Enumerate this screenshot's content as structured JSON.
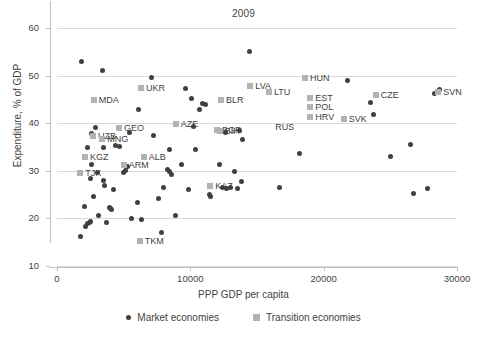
{
  "chart_data": {
    "type": "scatter",
    "title": "2009",
    "xlabel": "PPP GDP per capita",
    "ylabel": "Expenditure, % of GDP",
    "xlim": [
      0,
      30000
    ],
    "ylim": [
      10,
      60
    ],
    "xticks": [
      0,
      10000,
      20000,
      30000
    ],
    "xtick_labels": [
      "0",
      "10000",
      "20000",
      "30000"
    ],
    "yticks": [
      10,
      20,
      30,
      40,
      50,
      60
    ],
    "ytick_labels": [
      "10",
      "20",
      "30",
      "40",
      "50",
      "60"
    ],
    "grid": "horizontal",
    "legend_position": "bottom-center",
    "colors": {
      "market": "#404040",
      "transition": "#b3b3b3",
      "grid": "#d9d9d9",
      "axis": "#bfbfbf",
      "text": "#3f3f3f"
    },
    "series": [
      {
        "name": "Market economies",
        "marker": "circle",
        "color": "#404040",
        "points": [
          [
            1850,
            52.9
          ],
          [
            1750,
            16.3
          ],
          [
            2050,
            22.5
          ],
          [
            2150,
            18.4
          ],
          [
            2300,
            19.0
          ],
          [
            2400,
            19.2
          ],
          [
            2500,
            19.3
          ],
          [
            2250,
            34.8
          ],
          [
            2600,
            31.3
          ],
          [
            2500,
            28.3
          ],
          [
            2750,
            24.5
          ],
          [
            2600,
            37.9
          ],
          [
            2900,
            39.0
          ],
          [
            3050,
            29.6
          ],
          [
            3100,
            20.7
          ],
          [
            3400,
            51.1
          ],
          [
            3500,
            35.0
          ],
          [
            3550,
            26.9
          ],
          [
            3500,
            27.9
          ],
          [
            3700,
            19.1
          ],
          [
            3900,
            22.2
          ],
          [
            4000,
            22.1
          ],
          [
            4050,
            21.8
          ],
          [
            4250,
            26.1
          ],
          [
            4400,
            35.3
          ],
          [
            4700,
            35.2
          ],
          [
            5000,
            29.7
          ],
          [
            5100,
            30.0
          ],
          [
            5300,
            31.0
          ],
          [
            5400,
            38.0
          ],
          [
            5600,
            20.0
          ],
          [
            6000,
            23.4
          ],
          [
            6100,
            42.8
          ],
          [
            6300,
            19.8
          ],
          [
            7100,
            49.7
          ],
          [
            7250,
            37.4
          ],
          [
            7600,
            24.2
          ],
          [
            7800,
            17.0
          ],
          [
            8000,
            26.5
          ],
          [
            8300,
            30.2
          ],
          [
            8400,
            29.9
          ],
          [
            8450,
            34.4
          ],
          [
            8600,
            29.2
          ],
          [
            8900,
            20.6
          ],
          [
            9300,
            31.4
          ],
          [
            9600,
            47.2
          ],
          [
            9850,
            26.0
          ],
          [
            10100,
            45.2
          ],
          [
            10200,
            39.4
          ],
          [
            10400,
            34.4
          ],
          [
            10700,
            42.9
          ],
          [
            10900,
            44.1
          ],
          [
            11100,
            44.0
          ],
          [
            11400,
            25.0
          ],
          [
            11500,
            24.7
          ],
          [
            12200,
            31.4
          ],
          [
            12400,
            26.4
          ],
          [
            12600,
            38.1
          ],
          [
            12700,
            26.2
          ],
          [
            13000,
            26.4
          ],
          [
            13300,
            29.8
          ],
          [
            13500,
            26.3
          ],
          [
            13700,
            38.5
          ],
          [
            13800,
            27.8
          ],
          [
            13900,
            36.6
          ],
          [
            14400,
            55.1
          ],
          [
            16700,
            26.4
          ],
          [
            18200,
            33.6
          ],
          [
            21800,
            48.9
          ],
          [
            23500,
            44.4
          ],
          [
            23700,
            41.9
          ],
          [
            25000,
            33.0
          ],
          [
            26500,
            35.5
          ],
          [
            26700,
            25.2
          ],
          [
            27800,
            26.3
          ],
          [
            28300,
            46.3
          ],
          [
            28500,
            46.4
          ],
          [
            28700,
            47.0
          ]
        ]
      },
      {
        "name": "Transition economies",
        "marker": "square",
        "color": "#b3b3b3",
        "points": [
          {
            "code": "TJK",
            "x": 1750,
            "y": 29.5
          },
          {
            "code": "KGZ",
            "x": 2100,
            "y": 32.8
          },
          {
            "code": "UZB",
            "x": 2700,
            "y": 37.3
          },
          {
            "code": "MDA",
            "x": 2750,
            "y": 44.8
          },
          {
            "code": "MNG",
            "x": 3400,
            "y": 36.6
          },
          {
            "code": "ARM",
            "x": 5000,
            "y": 31.3
          },
          {
            "code": "GEO",
            "x": 4650,
            "y": 38.9
          },
          {
            "code": "ALB",
            "x": 6500,
            "y": 33.0
          },
          {
            "code": "TKM",
            "x": 6200,
            "y": 15.3
          },
          {
            "code": "UKR",
            "x": 6300,
            "y": 47.3
          },
          {
            "code": "AZE",
            "x": 8900,
            "y": 39.8
          },
          {
            "code": "BGR",
            "x": 12000,
            "y": 38.5
          },
          {
            "code": "BIH",
            "x": 12200,
            "y": 38.3
          },
          {
            "code": "BLR",
            "x": 12300,
            "y": 44.9
          },
          {
            "code": "KAZ",
            "x": 11500,
            "y": 26.9
          },
          {
            "code": "LVA",
            "x": 14500,
            "y": 47.9
          },
          {
            "code": "LTU",
            "x": 15900,
            "y": 46.6
          },
          {
            "code": "HUN",
            "x": 18600,
            "y": 49.6
          },
          {
            "code": "EST",
            "x": 19000,
            "y": 45.3
          },
          {
            "code": "POL",
            "x": 19000,
            "y": 43.5
          },
          {
            "code": "HRV",
            "x": 19000,
            "y": 41.4
          },
          {
            "code": "SVK",
            "x": 21500,
            "y": 40.9
          },
          {
            "code": "CZE",
            "x": 23900,
            "y": 46.0
          },
          {
            "code": "SVN",
            "x": 28600,
            "y": 46.5
          },
          {
            "code": "RUS",
            "x": 16000,
            "y": 39.2,
            "marker": "none"
          }
        ]
      }
    ]
  },
  "legend": {
    "entries": [
      {
        "label": "Market economies",
        "marker": "circle",
        "color": "#404040"
      },
      {
        "label": "Transition economies",
        "marker": "square",
        "color": "#b3b3b3"
      }
    ]
  }
}
